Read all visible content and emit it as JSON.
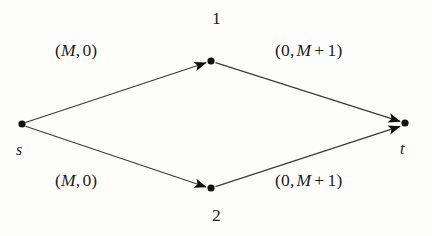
{
  "figure": {
    "type": "network-flow-graph",
    "background_color": "#fdfdfc",
    "ink_color": "#1d1d1d"
  },
  "nodes": [
    {
      "id": "s",
      "label": "s",
      "x": 22,
      "y": 124,
      "role": "source"
    },
    {
      "id": "1",
      "label": "1",
      "x": 211,
      "y": 61,
      "role": "intermediate"
    },
    {
      "id": "2",
      "label": "2",
      "x": 211,
      "y": 188,
      "role": "intermediate"
    },
    {
      "id": "t",
      "label": "t",
      "x": 405,
      "y": 123,
      "role": "sink"
    }
  ],
  "edges": [
    {
      "id": "s-1",
      "from": "s",
      "to": "1",
      "label": {
        "open": "(",
        "first": "M",
        "comma": ",",
        "second": "0",
        "close": ")"
      },
      "label_text": "(M, 0)"
    },
    {
      "id": "1-t",
      "from": "1",
      "to": "t",
      "label": {
        "open": "(",
        "first": "0",
        "comma": ",",
        "second": "M",
        "plus": "+",
        "addend": "1",
        "close": ")"
      },
      "label_text": "(0, M + 1)"
    },
    {
      "id": "s-2",
      "from": "s",
      "to": "2",
      "label": {
        "open": "(",
        "first": "M",
        "comma": ",",
        "second": "0",
        "close": ")"
      },
      "label_text": "(M, 0)"
    },
    {
      "id": "2-t",
      "from": "2",
      "to": "t",
      "label": {
        "open": "(",
        "first": "0",
        "comma": ",",
        "second": "M",
        "plus": "+",
        "addend": "1",
        "close": ")"
      },
      "label_text": "(0, M + 1)"
    }
  ],
  "labels": {
    "edge_s1_open": "(",
    "edge_s1_cap": "M",
    "edge_s1_sep": ",",
    "edge_s1_cost": "0",
    "edge_s1_close": ")",
    "edge_1t_open": "(",
    "edge_1t_cap": "0",
    "edge_1t_sep": ",",
    "edge_1t_cost": "M",
    "edge_1t_plus": "+",
    "edge_1t_addend": "1",
    "edge_1t_close": ")",
    "edge_s2_open": "(",
    "edge_s2_cap": "M",
    "edge_s2_sep": ",",
    "edge_s2_cost": "0",
    "edge_s2_close": ")",
    "edge_2t_open": "(",
    "edge_2t_cap": "0",
    "edge_2t_sep": ",",
    "edge_2t_cost": "M",
    "edge_2t_plus": "+",
    "edge_2t_addend": "1",
    "edge_2t_close": ")",
    "node_1": "1",
    "node_2": "2",
    "node_s": "s",
    "node_t": "t"
  }
}
